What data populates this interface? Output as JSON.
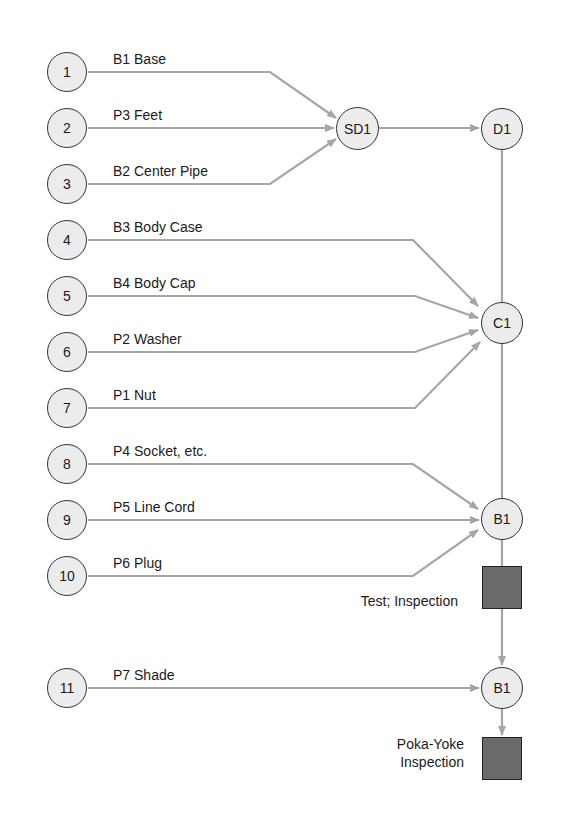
{
  "colors": {
    "line": "#a6a6a6",
    "node_fill": "#ececec",
    "node_border": "#333333",
    "inspection_fill": "#6a6a6a"
  },
  "parts": [
    {
      "num": "1",
      "label": "B1 Base",
      "y": 72,
      "target": "SD1"
    },
    {
      "num": "2",
      "label": "P3 Feet",
      "y": 128,
      "target": "SD1"
    },
    {
      "num": "3",
      "label": "B2 Center Pipe",
      "y": 184,
      "target": "SD1"
    },
    {
      "num": "4",
      "label": "B3 Body Case",
      "y": 240,
      "target": "C1"
    },
    {
      "num": "5",
      "label": "B4 Body Cap",
      "y": 296,
      "target": "C1"
    },
    {
      "num": "6",
      "label": "P2 Washer",
      "y": 352,
      "target": "C1"
    },
    {
      "num": "7",
      "label": "P1 Nut",
      "y": 408,
      "target": "C1"
    },
    {
      "num": "8",
      "label": "P4 Socket, etc.",
      "y": 464,
      "target": "B1"
    },
    {
      "num": "9",
      "label": "P5 Line Cord",
      "y": 520,
      "target": "B1"
    },
    {
      "num": "10",
      "label": "P6 Plug",
      "y": 576,
      "target": "B1"
    },
    {
      "num": "11",
      "label": "P7 Shade",
      "y": 688,
      "target": "B1-final"
    }
  ],
  "nodes": {
    "sd1": {
      "label": "SD1"
    },
    "d1": {
      "label": "D1"
    },
    "c1": {
      "label": "C1"
    },
    "b1": {
      "label": "B1"
    },
    "b1_final": {
      "label": "B1"
    }
  },
  "inspections": {
    "test": {
      "label": "Test; Inspection"
    },
    "pokayoke": {
      "line1": "Poka-Yoke",
      "line2": "Inspection"
    }
  }
}
